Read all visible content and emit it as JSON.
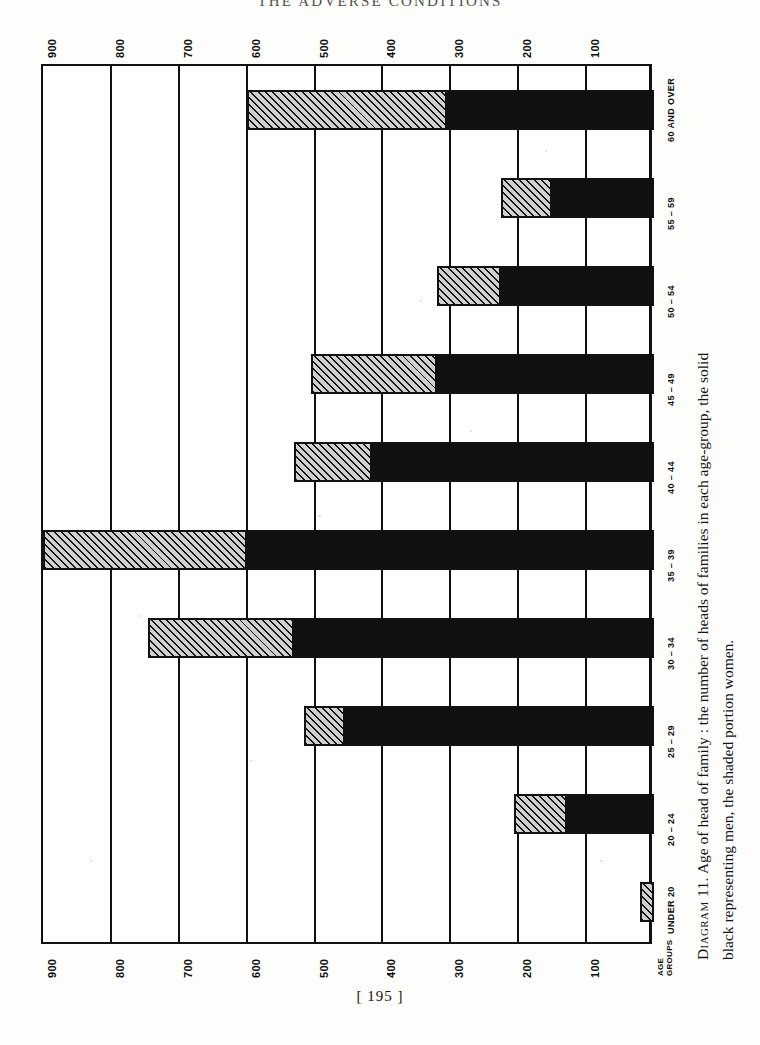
{
  "page": {
    "running_head": "THE  ADVERSE  CONDITIONS",
    "folio": "[ 195 ]"
  },
  "caption": {
    "figure_label": "Diagram 11.",
    "line1": "Age of head of family : the number of heads of families in each age-group, the solid",
    "line2": "black representing men, the shaded portion women.",
    "full": "Diagram 11.  Age of head of family : the number of heads of families in each age-group, the solid black representing men, the shaded portion women."
  },
  "legend": {
    "men_label": "solid black representing men",
    "women_label": "the shaded portion women",
    "men_color": "#111111",
    "women_color": "#cfcfcf"
  },
  "axis": {
    "category_axis_title_line1": "AGE",
    "category_axis_title_line2": "GROUPS",
    "value_tick_labels": [
      "900",
      "800",
      "700",
      "600",
      "500",
      "400",
      "300",
      "200",
      "100"
    ]
  },
  "chart_data": {
    "type": "bar",
    "title": "Age of head of family",
    "orientation": "horizontal",
    "stacked": true,
    "xlabel": "",
    "ylabel": "AGE GROUPS",
    "xlim": [
      0,
      900
    ],
    "grid": true,
    "legend_position": "caption",
    "categories": [
      "UNDER 20",
      "20 – 24",
      "25 – 29",
      "30 – 34",
      "35 – 39",
      "40 – 44",
      "45 – 49",
      "50 – 54",
      "55 – 59",
      "60 AND OVER"
    ],
    "series": [
      {
        "name": "Men (solid black)",
        "color": "#111111",
        "values": [
          0,
          128,
          455,
          530,
          600,
          415,
          320,
          225,
          150,
          305
        ]
      },
      {
        "name": "Women (shaded)",
        "color": "#cfcfcf",
        "values": [
          20,
          78,
          60,
          215,
          300,
          115,
          185,
          95,
          75,
          295
        ]
      }
    ],
    "totals": [
      20,
      206,
      515,
      745,
      900,
      530,
      505,
      320,
      225,
      600
    ]
  }
}
